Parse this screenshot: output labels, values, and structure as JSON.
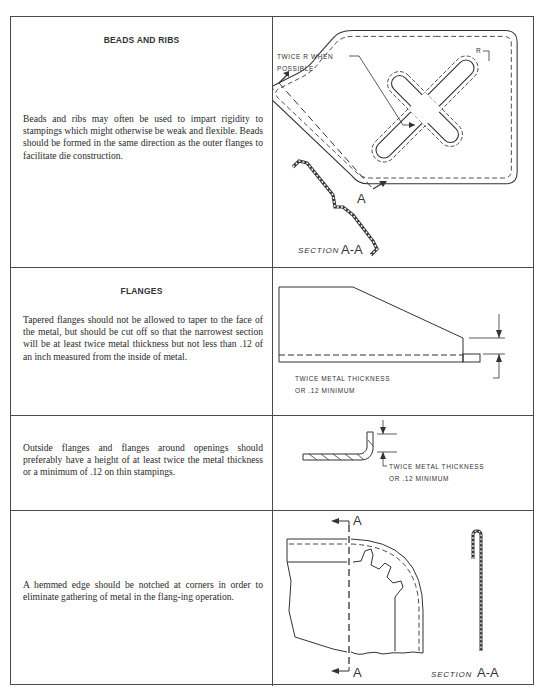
{
  "sections": [
    {
      "heading": "BEADS AND RIBS",
      "body": "Beads and ribs may often be used to impart rigidity to stampings which might otherwise be weak and flexible. Beads should be formed in the same direction as the outer flanges to facilitate die construction.",
      "figure": {
        "callout": "TWICE R WHEN",
        "callout_line2": "POSSIBLE",
        "radius_label": "R",
        "section_marker_top": "A",
        "section_marker_bottom": "A",
        "section_label_prefix": "SECTION",
        "section_label_id": "A-A"
      }
    },
    {
      "heading": "FLANGES",
      "body": "Tapered flanges should not be allowed to taper to the face of the metal, but should be cut off so that the narrowest section will be at least twice metal thickness but not less than .12 of an inch measured from the inside of metal.",
      "figure": {
        "dimension_label_line1": "TWICE METAL THICKNESS",
        "dimension_label_line2": "OR .12 MINIMUM"
      }
    },
    {
      "heading": "",
      "body": "Outside flanges and flanges around openings should preferably have a height of at least twice the metal thickness or a minimum of .12 on thin stampings.",
      "figure": {
        "dimension_label_line1": "TWICE METAL THICKNESS",
        "dimension_label_line2": "OR .12 MINIMUM"
      }
    },
    {
      "heading": "",
      "body": "A hemmed edge should be notched at corners in order to eliminate gathering of metal in the flang-ing operation.",
      "figure": {
        "section_marker_top": "A",
        "section_marker_bottom": "A",
        "section_label_prefix": "SECTION",
        "section_label_id": "A-A"
      }
    }
  ]
}
